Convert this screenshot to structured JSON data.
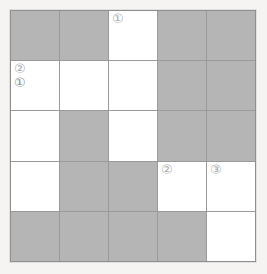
{
  "grid": {
    "rows": 5,
    "columns": 5,
    "shaded_color": "#b5b5b5",
    "empty_color": "#ffffff",
    "line_color": "#9a9a9a",
    "background_color": "#f5f4f2",
    "mark_color": "#a9a9a9",
    "cells": [
      [
        {
          "shaded": true,
          "marks": []
        },
        {
          "shaded": true,
          "marks": []
        },
        {
          "shaded": false,
          "marks": [
            "①"
          ]
        },
        {
          "shaded": true,
          "marks": []
        },
        {
          "shaded": true,
          "marks": []
        }
      ],
      [
        {
          "shaded": false,
          "marks": [
            "②",
            "①"
          ]
        },
        {
          "shaded": false,
          "marks": []
        },
        {
          "shaded": false,
          "marks": []
        },
        {
          "shaded": true,
          "marks": []
        },
        {
          "shaded": true,
          "marks": []
        }
      ],
      [
        {
          "shaded": false,
          "marks": []
        },
        {
          "shaded": true,
          "marks": []
        },
        {
          "shaded": false,
          "marks": []
        },
        {
          "shaded": true,
          "marks": []
        },
        {
          "shaded": true,
          "marks": []
        }
      ],
      [
        {
          "shaded": false,
          "marks": []
        },
        {
          "shaded": true,
          "marks": []
        },
        {
          "shaded": true,
          "marks": []
        },
        {
          "shaded": false,
          "marks": [
            "②"
          ]
        },
        {
          "shaded": false,
          "marks": [
            "③"
          ]
        }
      ],
      [
        {
          "shaded": true,
          "marks": []
        },
        {
          "shaded": true,
          "marks": []
        },
        {
          "shaded": true,
          "marks": []
        },
        {
          "shaded": true,
          "marks": []
        },
        {
          "shaded": false,
          "marks": []
        }
      ]
    ]
  }
}
